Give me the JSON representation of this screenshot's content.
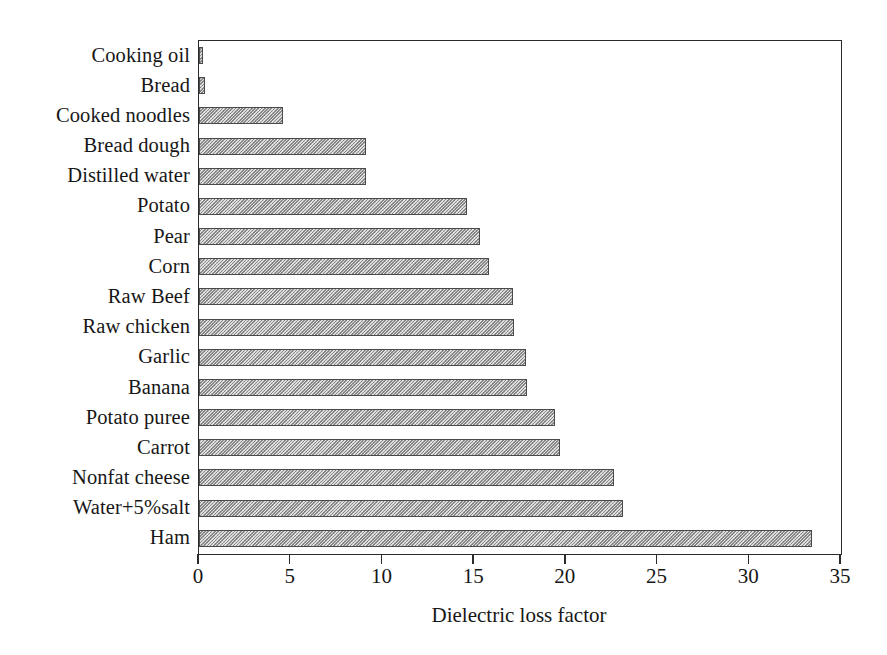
{
  "chart_data": {
    "type": "bar",
    "orientation": "horizontal",
    "title": "",
    "xlabel": "Dielectric loss factor",
    "ylabel": "",
    "xlim": [
      0,
      35
    ],
    "xticks": [
      "0",
      "5",
      "10",
      "15",
      "20",
      "25",
      "30",
      "35"
    ],
    "grid": false,
    "legend": null,
    "categories": [
      "Cooking oil",
      "Bread",
      "Cooked noodles",
      "Bread dough",
      "Distilled water",
      "Potato",
      "Pear",
      "Corn",
      "Raw Beef",
      "Raw chicken",
      "Garlic",
      "Banana",
      "Potato puree",
      "Carrot",
      "Nonfat cheese",
      "Water+5%salt",
      "Ham"
    ],
    "values": [
      0.2,
      0.35,
      4.6,
      9.1,
      9.1,
      14.6,
      15.3,
      15.8,
      17.1,
      17.2,
      17.8,
      17.9,
      19.4,
      19.7,
      22.6,
      23.1,
      33.4
    ],
    "bar_fill_color": "#b6b6b6",
    "bar_edge_color": "#4a4a4a",
    "bar_pattern": "diagonal-hatch",
    "axis_color": "#2b2b2b",
    "background_color": "#ffffff"
  }
}
